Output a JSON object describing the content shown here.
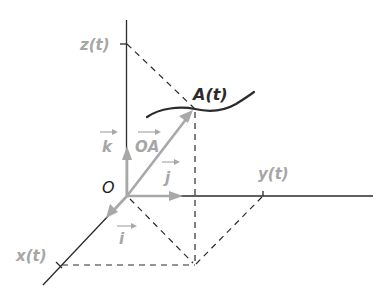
{
  "diagram": {
    "colors": {
      "axis": "#2b2b2b",
      "vector": "#a8a8a8",
      "label_gray": "#a6a6a6",
      "label_dark": "#2b2b2b"
    },
    "labels": {
      "origin": "O",
      "point": "A(t)",
      "x_coord": "x(t)",
      "y_coord": "y(t)",
      "z_coord": "z(t)",
      "unit_i": "i",
      "unit_j": "j",
      "unit_k": "k",
      "position_vector": "OA"
    },
    "points": {
      "origin": [
        127,
        196
      ],
      "A": [
        195,
        109
      ],
      "base_projection": [
        195,
        265
      ],
      "x_tick": [
        61,
        265
      ],
      "y_tick": [
        263,
        196
      ],
      "z_tick": [
        126,
        44
      ]
    }
  }
}
